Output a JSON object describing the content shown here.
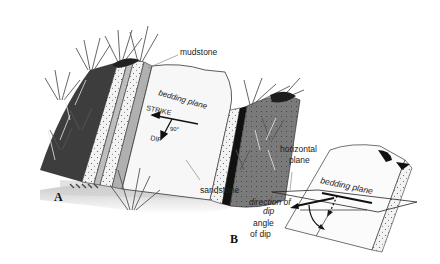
{
  "diagram": {
    "topic": "Strike and dip of sedimentary beds",
    "panels": [
      {
        "id": "A",
        "label": "A",
        "labels": {
          "mudstone": "mudstone",
          "bedding_plane": "bedding plane",
          "strike": "STRIKE",
          "angle": "90°",
          "dip": "DIP",
          "sandstone": "sandstone"
        }
      },
      {
        "id": "B",
        "label": "B",
        "labels": {
          "horizontal_plane_1": "horizontal",
          "horizontal_plane_2": "plane",
          "bedding_plane": "bedding plane",
          "direction_of_dip_1": "direction of",
          "direction_of_dip_2": "dip",
          "angle_of_dip_1": "angle",
          "angle_of_dip_2": "of dip"
        }
      }
    ],
    "colors": {
      "ink": "#222222",
      "vegetation_dark": "#3a3a3a",
      "mudstone": "#bdbdbd",
      "sandstone": "#f2f2f2",
      "bedding_plane": "#f7f7f7",
      "ground_shadow": "#d6d6d6"
    }
  }
}
